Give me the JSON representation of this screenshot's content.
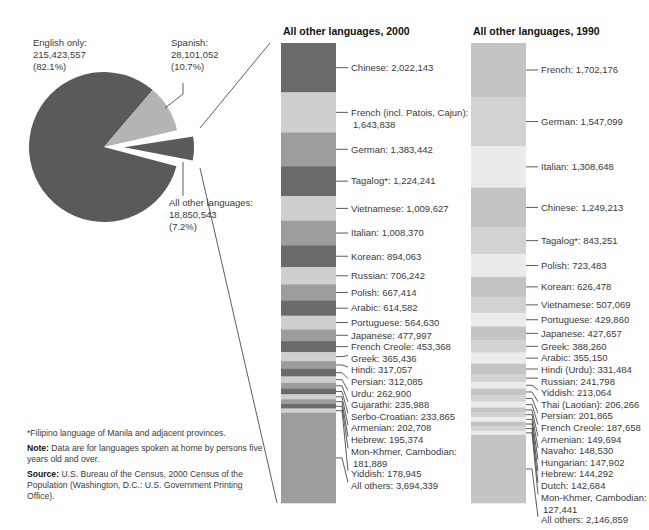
{
  "chart_data": [
    {
      "type": "pie",
      "title": "",
      "slices": [
        {
          "label": "English only",
          "value": 215423557,
          "percent": 82.1,
          "text": [
            "English only:",
            "215,423,557",
            "(82.1%)"
          ],
          "color": "#5a5a5a"
        },
        {
          "label": "Spanish",
          "value": 28101052,
          "percent": 10.7,
          "text": [
            "Spanish:",
            "28,101,052",
            "(10.7%)"
          ],
          "color": "#b4b4b4"
        },
        {
          "label": "All other languages",
          "value": 18850543,
          "percent": 7.2,
          "text": [
            "All other languages:",
            "18,850,543",
            "(7.2%)"
          ],
          "color": "#5a5a5a",
          "exploded": true
        }
      ]
    },
    {
      "type": "bar",
      "stacked": true,
      "title": "All other languages, 2000",
      "categories": [
        "Chinese",
        "French (incl. Patois, Cajun)",
        "German",
        "Tagalog*",
        "Vietnamese",
        "Italian",
        "Korean",
        "Russian",
        "Polish",
        "Arabic",
        "Portuguese",
        "Japanese",
        "French Creole",
        "Greek",
        "Hindi",
        "Persian",
        "Urdu",
        "Gujarathi",
        "Serbo-Croatian",
        "Armenian",
        "Hebrew",
        "Mon-Khmer, Cambodian",
        "Yiddish",
        "All others"
      ],
      "values": [
        2022143,
        1643838,
        1383442,
        1224241,
        1009627,
        1008370,
        894063,
        706242,
        667414,
        614582,
        564630,
        477997,
        453368,
        365436,
        317057,
        312085,
        262900,
        235988,
        233865,
        202708,
        195374,
        181889,
        178945,
        3694339
      ]
    },
    {
      "type": "bar",
      "stacked": true,
      "title": "All other languages, 1990",
      "categories": [
        "French",
        "German",
        "Italian",
        "Chinese",
        "Tagalog*",
        "Polish",
        "Korean",
        "Vietnamese",
        "Portuguese",
        "Japanese",
        "Greek",
        "Arabic",
        "Hindi (Urdu)",
        "Russian",
        "Yiddish",
        "Thai (Laotian)",
        "Persian",
        "French Creole",
        "Armenian",
        "Navaho",
        "Hungarian",
        "Hebrew",
        "Dutch",
        "Mon-Khmer, Cambodian",
        "All others"
      ],
      "values": [
        1702176,
        1547099,
        1308648,
        1249213,
        843251,
        723483,
        626478,
        507069,
        429860,
        427657,
        388260,
        355150,
        331484,
        241798,
        213064,
        206266,
        201865,
        187658,
        149694,
        148530,
        147902,
        144292,
        142684,
        127441,
        2146859
      ]
    }
  ],
  "pie": {
    "english_label": [
      "English only:",
      "215,423,557",
      "(82.1%)"
    ],
    "spanish_label": [
      "Spanish:",
      "28,101,052",
      "(10.7%)"
    ],
    "other_label": [
      "All other languages:",
      "18,850,543",
      "(7.2%)"
    ]
  },
  "bar2000": {
    "title": "All other languages, 2000",
    "segments": [
      {
        "label": "Chinese: 2,022,143",
        "value": 2022143,
        "color": "#6a6a6a"
      },
      {
        "label": "French (incl. Patois, Cajun):|1,643,838",
        "value": 1643838,
        "color": "#cfcfcf"
      },
      {
        "label": "German: 1,383,442",
        "value": 1383442,
        "color": "#9d9d9d"
      },
      {
        "label": "Tagalog*: 1,224,241",
        "value": 1224241,
        "color": "#6a6a6a"
      },
      {
        "label": "Vietnamese: 1,009,627",
        "value": 1009627,
        "color": "#cfcfcf"
      },
      {
        "label": "Italian: 1,008,370",
        "value": 1008370,
        "color": "#9d9d9d"
      },
      {
        "label": "Korean: 894,063",
        "value": 894063,
        "color": "#6a6a6a"
      },
      {
        "label": "Russian: 706,242",
        "value": 706242,
        "color": "#cfcfcf"
      },
      {
        "label": "Polish: 667,414",
        "value": 667414,
        "color": "#9d9d9d"
      },
      {
        "label": "Arabic: 614,582",
        "value": 614582,
        "color": "#6a6a6a"
      },
      {
        "label": "Portuguese: 564,630",
        "value": 564630,
        "color": "#cfcfcf"
      },
      {
        "label": "Japanese: 477,997",
        "value": 477997,
        "color": "#9d9d9d"
      },
      {
        "label": "French Creole: 453,368",
        "value": 453368,
        "color": "#6a6a6a"
      },
      {
        "label": "Greek: 365,436",
        "value": 365436,
        "color": "#cfcfcf"
      },
      {
        "label": "Hindi: 317,057",
        "value": 317057,
        "color": "#9d9d9d"
      },
      {
        "label": "Persian: 312,085",
        "value": 312085,
        "color": "#6a6a6a"
      },
      {
        "label": "Urdu: 262,900",
        "value": 262900,
        "color": "#cfcfcf"
      },
      {
        "label": "Gujarathi: 235,988",
        "value": 235988,
        "color": "#9d9d9d"
      },
      {
        "label": "Serbo-Croatian: 233,865",
        "value": 233865,
        "color": "#6a6a6a"
      },
      {
        "label": "Armenian: 202,708",
        "value": 202708,
        "color": "#cfcfcf"
      },
      {
        "label": "Hebrew: 195,374",
        "value": 195374,
        "color": "#9d9d9d"
      },
      {
        "label": "Mon-Khmer, Cambodian:|181,889",
        "value": 181889,
        "color": "#6a6a6a"
      },
      {
        "label": "Yiddish: 178,945",
        "value": 178945,
        "color": "#cfcfcf"
      },
      {
        "label": "All others: 3,694,339",
        "value": 3694339,
        "color": "#9d9d9d"
      }
    ]
  },
  "bar1990": {
    "title": "All other languages, 1990",
    "segments": [
      {
        "label": "French: 1,702,176",
        "value": 1702176,
        "color": "#c4c4c4"
      },
      {
        "label": "German: 1,547,099",
        "value": 1547099,
        "color": "#d2d2d2"
      },
      {
        "label": "Italian: 1,308,648",
        "value": 1308648,
        "color": "#ebebeb"
      },
      {
        "label": "Chinese: 1,249,213",
        "value": 1249213,
        "color": "#c4c4c4"
      },
      {
        "label": "Tagalog*: 843,251",
        "value": 843251,
        "color": "#d2d2d2"
      },
      {
        "label": "Polish: 723,483",
        "value": 723483,
        "color": "#ebebeb"
      },
      {
        "label": "Korean: 626,478",
        "value": 626478,
        "color": "#c4c4c4"
      },
      {
        "label": "Vietnamese: 507,069",
        "value": 507069,
        "color": "#d2d2d2"
      },
      {
        "label": "Portuguese: 429,860",
        "value": 429860,
        "color": "#ebebeb"
      },
      {
        "label": "Japanese: 427,657",
        "value": 427657,
        "color": "#c4c4c4"
      },
      {
        "label": "Greek: 388,260",
        "value": 388260,
        "color": "#d2d2d2"
      },
      {
        "label": "Arabic: 355,150",
        "value": 355150,
        "color": "#ebebeb"
      },
      {
        "label": "Hindi (Urdu): 331,484",
        "value": 331484,
        "color": "#c4c4c4"
      },
      {
        "label": "Russian: 241,798",
        "value": 241798,
        "color": "#d2d2d2"
      },
      {
        "label": "Yiddish: 213,064",
        "value": 213064,
        "color": "#ebebeb"
      },
      {
        "label": "Thai (Laotian): 206,266",
        "value": 206266,
        "color": "#c4c4c4"
      },
      {
        "label": "Persian: 201,865",
        "value": 201865,
        "color": "#d2d2d2"
      },
      {
        "label": "French Creole: 187,658",
        "value": 187658,
        "color": "#ebebeb"
      },
      {
        "label": "Armenian: 149,694",
        "value": 149694,
        "color": "#c4c4c4"
      },
      {
        "label": "Navaho: 148,530",
        "value": 148530,
        "color": "#d2d2d2"
      },
      {
        "label": "Hungarian: 147,902",
        "value": 147902,
        "color": "#ebebeb"
      },
      {
        "label": "Hebrew: 144,292",
        "value": 144292,
        "color": "#c4c4c4"
      },
      {
        "label": "Dutch: 142,684",
        "value": 142684,
        "color": "#d2d2d2"
      },
      {
        "label": "Mon-Khmer, Cambodian:|127,441",
        "value": 127441,
        "color": "#ebebeb"
      },
      {
        "label": "All others: 2,146,859",
        "value": 2146859,
        "color": "#c4c4c4"
      }
    ]
  },
  "notes": {
    "footnote": "*Filipino language of Manila and adjacent provinces.",
    "note_label": "Note:",
    "note_text": " Data are for languages spoken at home by persons five years old and over.",
    "source_label": "Source:",
    "source_text": " U.S. Bureau of the Census, 2000 Census of the Population (Washington, D.C.: U.S. Government Printing Office)."
  }
}
